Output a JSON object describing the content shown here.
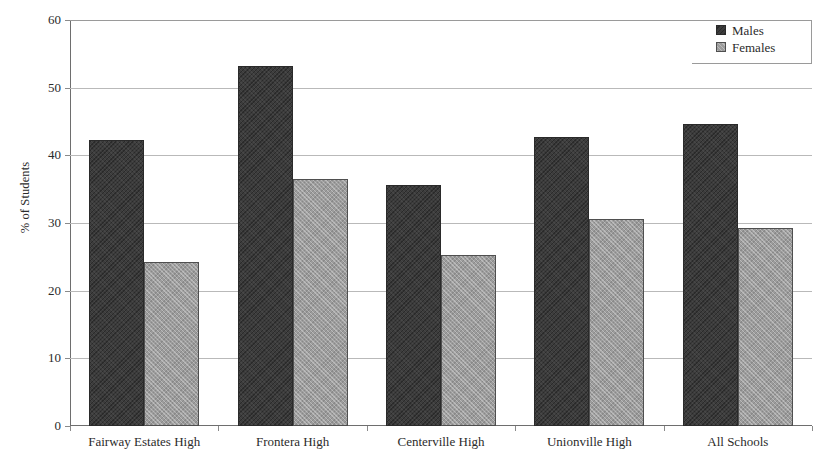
{
  "chart_data": {
    "type": "bar",
    "title": "",
    "xlabel": "",
    "ylabel": "% of Students",
    "ylim": [
      0,
      60
    ],
    "yticks": [
      0,
      10,
      20,
      30,
      40,
      50,
      60
    ],
    "ytick_labels": [
      "0",
      "10",
      "20",
      "30",
      "40",
      "50",
      "60"
    ],
    "grid": true,
    "legend_position": "top-right",
    "categories": [
      "Fairway Estates High",
      "Frontera High",
      "Centerville High",
      "Unionville High",
      "All Schools"
    ],
    "series": [
      {
        "name": "Males",
        "color": "#3c3c3c",
        "values": [
          42.2,
          53.2,
          35.6,
          42.7,
          44.6
        ]
      },
      {
        "name": "Females",
        "color": "#9c9c9c",
        "values": [
          24.2,
          36.5,
          25.2,
          30.6,
          29.2
        ]
      }
    ]
  },
  "legend": {
    "items": [
      {
        "label": "Males",
        "swatch": "males-swatch"
      },
      {
        "label": "Females",
        "swatch": "females-swatch"
      }
    ]
  },
  "colors": {
    "males": "#3c3c3c",
    "females": "#9c9c9c",
    "axis": "#6e6e6e",
    "gridline": "#b9b9b9",
    "text": "#2b2b2b",
    "background": "#ffffff"
  }
}
